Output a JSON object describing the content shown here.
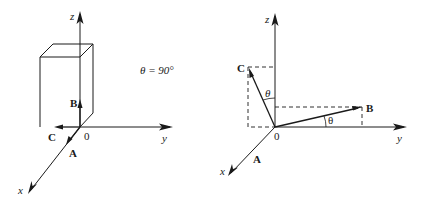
{
  "left_panel": {
    "axes": {
      "z": "z",
      "y": "y",
      "x": "x",
      "origin": "0"
    },
    "vectors": {
      "A": "A",
      "B": "B",
      "C": "C"
    },
    "angle_text": "θ = 90°"
  },
  "right_panel": {
    "axes": {
      "z": "z",
      "y": "y",
      "x": "x",
      "origin": "0"
    },
    "vectors": {
      "A": "A",
      "B": "B",
      "C": "C"
    },
    "angle_label_zc": "θ",
    "angle_label_yb": "θ"
  }
}
